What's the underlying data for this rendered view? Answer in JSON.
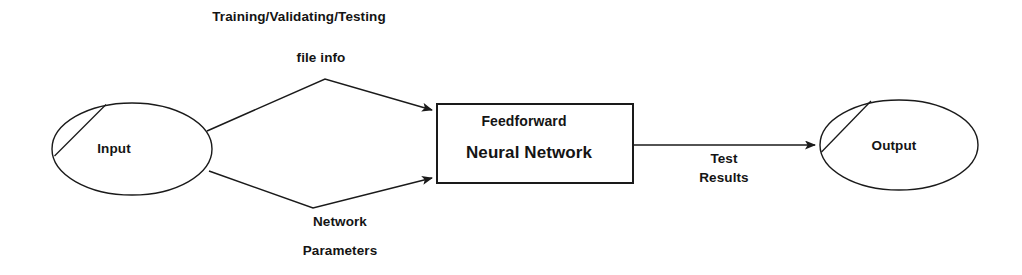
{
  "diagram": {
    "type": "flow-diagram",
    "background_color": "#ffffff",
    "stroke_color": "#1a1a1a",
    "text_color": "#141414",
    "nodes": [
      {
        "id": "input",
        "shape": "ellipse",
        "label": "Input",
        "cx": 132,
        "cy": 149,
        "rx": 80,
        "ry": 46
      },
      {
        "id": "network",
        "shape": "rectangle",
        "label_line1": "Feedforward",
        "label_line2": "Neural Network",
        "x": 437,
        "y": 104,
        "width": 196,
        "height": 79
      },
      {
        "id": "output",
        "shape": "ellipse",
        "label": "Output",
        "cx": 899,
        "cy": 145,
        "rx": 79,
        "ry": 45
      }
    ],
    "edges": [
      {
        "id": "input-to-network-top",
        "from": "input",
        "to": "network",
        "label_line1": "Training/Validating/Testing",
        "label_line2": "file info",
        "label_position": "above",
        "arrowhead": "to-network-top-left"
      },
      {
        "id": "input-to-network-bottom",
        "from": "input",
        "to": "network",
        "label_line1": "Network",
        "label_line2": "Parameters",
        "label_position": "below",
        "arrowhead": "to-network-bottom-left"
      },
      {
        "id": "network-to-output",
        "from": "network",
        "to": "output",
        "label_line1": "Test",
        "label_line2": "Results",
        "label_position": "below",
        "arrowhead": "to-output-left"
      }
    ],
    "labels": {
      "training_files": "Training/Validating/Testing",
      "file_info": "file info",
      "network_word": "Network",
      "parameters_word": "Parameters",
      "test_word": "Test",
      "results_word": "Results",
      "input_node": "Input",
      "output_node": "Output",
      "feedforward": "Feedforward",
      "neural_network": "Neural Network"
    }
  }
}
